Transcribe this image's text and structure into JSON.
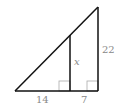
{
  "diagram": {
    "type": "similar-right-triangles",
    "labels": {
      "base_left": "14",
      "base_right": "7",
      "right_side": "22",
      "inner_segment": "x"
    },
    "colors": {
      "lines": "#111111",
      "right_angle_marks": "#aaaaaa",
      "labels": "#888888"
    }
  }
}
